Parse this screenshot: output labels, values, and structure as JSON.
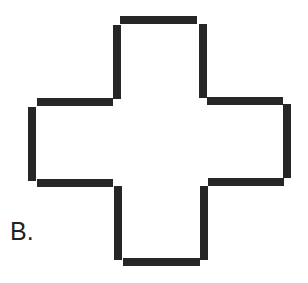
{
  "figure": {
    "label": "B.",
    "shape": "cross (plus sign) outline with broken corners",
    "stroke_color": "#262626",
    "background_color": "#ffffff",
    "segments": [
      {
        "name": "top-edge",
        "x": 120,
        "y": 16,
        "w": 77,
        "h": 8
      },
      {
        "name": "top-arm-left-edge",
        "x": 113,
        "y": 25,
        "w": 8,
        "h": 74
      },
      {
        "name": "top-arm-right-edge",
        "x": 199,
        "y": 24,
        "w": 8,
        "h": 74
      },
      {
        "name": "left-arm-top-edge",
        "x": 37,
        "y": 98,
        "w": 76,
        "h": 8
      },
      {
        "name": "right-arm-top-edge",
        "x": 207,
        "y": 97,
        "w": 76,
        "h": 8
      },
      {
        "name": "left-edge",
        "x": 28,
        "y": 107,
        "w": 8,
        "h": 74
      },
      {
        "name": "right-edge",
        "x": 283,
        "y": 104,
        "w": 8,
        "h": 74
      },
      {
        "name": "left-arm-bottom-edge",
        "x": 37,
        "y": 179,
        "w": 76,
        "h": 8
      },
      {
        "name": "right-arm-bottom-edge",
        "x": 208,
        "y": 178,
        "w": 76,
        "h": 8
      },
      {
        "name": "bottom-arm-left-edge",
        "x": 114,
        "y": 186,
        "w": 8,
        "h": 74
      },
      {
        "name": "bottom-arm-right-edge",
        "x": 200,
        "y": 186,
        "w": 8,
        "h": 74
      },
      {
        "name": "bottom-edge",
        "x": 123,
        "y": 258,
        "w": 77,
        "h": 8
      }
    ]
  }
}
